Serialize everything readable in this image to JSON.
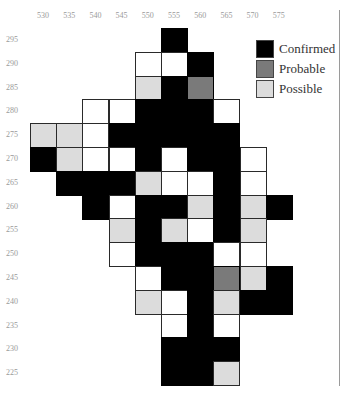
{
  "colors": {
    "confirmed": "#000000",
    "probable": "#7a7a7a",
    "possible": "#dcdcdc",
    "surveyed": "#ffffff"
  },
  "axes": {
    "x_labels": [
      "530",
      "535",
      "540",
      "545",
      "550",
      "555",
      "560",
      "565",
      "570",
      "575"
    ],
    "y_labels": [
      "295",
      "290",
      "285",
      "280",
      "275",
      "270",
      "265",
      "260",
      "255",
      "250",
      "245",
      "240",
      "235",
      "230",
      "225"
    ]
  },
  "legend": {
    "items": [
      {
        "key": "confirmed",
        "label": "Confirmed"
      },
      {
        "key": "probable",
        "label": "Probable"
      },
      {
        "key": "possible",
        "label": "Possible"
      }
    ]
  },
  "grid": {
    "origin_x": 30,
    "origin_y": 28,
    "cell_w": 26.2,
    "cell_h": 23.8,
    "cells": [
      {
        "x": 555,
        "y": 295,
        "s": "confirmed"
      },
      {
        "x": 550,
        "y": 290,
        "s": "surveyed"
      },
      {
        "x": 555,
        "y": 290,
        "s": "surveyed"
      },
      {
        "x": 560,
        "y": 290,
        "s": "confirmed"
      },
      {
        "x": 550,
        "y": 285,
        "s": "possible"
      },
      {
        "x": 555,
        "y": 285,
        "s": "confirmed"
      },
      {
        "x": 560,
        "y": 285,
        "s": "probable"
      },
      {
        "x": 540,
        "y": 280,
        "s": "surveyed"
      },
      {
        "x": 545,
        "y": 280,
        "s": "surveyed"
      },
      {
        "x": 550,
        "y": 280,
        "s": "confirmed"
      },
      {
        "x": 555,
        "y": 280,
        "s": "confirmed"
      },
      {
        "x": 560,
        "y": 280,
        "s": "confirmed"
      },
      {
        "x": 565,
        "y": 280,
        "s": "surveyed"
      },
      {
        "x": 530,
        "y": 275,
        "s": "possible"
      },
      {
        "x": 535,
        "y": 275,
        "s": "possible"
      },
      {
        "x": 540,
        "y": 275,
        "s": "surveyed"
      },
      {
        "x": 545,
        "y": 275,
        "s": "confirmed"
      },
      {
        "x": 550,
        "y": 275,
        "s": "confirmed"
      },
      {
        "x": 555,
        "y": 275,
        "s": "confirmed"
      },
      {
        "x": 560,
        "y": 275,
        "s": "confirmed"
      },
      {
        "x": 565,
        "y": 275,
        "s": "confirmed"
      },
      {
        "x": 530,
        "y": 270,
        "s": "confirmed"
      },
      {
        "x": 535,
        "y": 270,
        "s": "possible"
      },
      {
        "x": 540,
        "y": 270,
        "s": "surveyed"
      },
      {
        "x": 545,
        "y": 270,
        "s": "surveyed"
      },
      {
        "x": 550,
        "y": 270,
        "s": "confirmed"
      },
      {
        "x": 555,
        "y": 270,
        "s": "surveyed"
      },
      {
        "x": 560,
        "y": 270,
        "s": "confirmed"
      },
      {
        "x": 565,
        "y": 270,
        "s": "confirmed"
      },
      {
        "x": 570,
        "y": 270,
        "s": "surveyed"
      },
      {
        "x": 535,
        "y": 265,
        "s": "confirmed"
      },
      {
        "x": 540,
        "y": 265,
        "s": "confirmed"
      },
      {
        "x": 545,
        "y": 265,
        "s": "confirmed"
      },
      {
        "x": 550,
        "y": 265,
        "s": "possible"
      },
      {
        "x": 555,
        "y": 265,
        "s": "surveyed"
      },
      {
        "x": 560,
        "y": 265,
        "s": "surveyed"
      },
      {
        "x": 565,
        "y": 265,
        "s": "confirmed"
      },
      {
        "x": 570,
        "y": 265,
        "s": "surveyed"
      },
      {
        "x": 540,
        "y": 260,
        "s": "confirmed"
      },
      {
        "x": 545,
        "y": 260,
        "s": "surveyed"
      },
      {
        "x": 550,
        "y": 260,
        "s": "confirmed"
      },
      {
        "x": 555,
        "y": 260,
        "s": "confirmed"
      },
      {
        "x": 560,
        "y": 260,
        "s": "possible"
      },
      {
        "x": 565,
        "y": 260,
        "s": "confirmed"
      },
      {
        "x": 570,
        "y": 260,
        "s": "possible"
      },
      {
        "x": 575,
        "y": 260,
        "s": "confirmed"
      },
      {
        "x": 545,
        "y": 255,
        "s": "possible"
      },
      {
        "x": 550,
        "y": 255,
        "s": "confirmed"
      },
      {
        "x": 555,
        "y": 255,
        "s": "possible"
      },
      {
        "x": 560,
        "y": 255,
        "s": "surveyed"
      },
      {
        "x": 565,
        "y": 255,
        "s": "confirmed"
      },
      {
        "x": 570,
        "y": 255,
        "s": "possible"
      },
      {
        "x": 545,
        "y": 250,
        "s": "surveyed"
      },
      {
        "x": 550,
        "y": 250,
        "s": "confirmed"
      },
      {
        "x": 555,
        "y": 250,
        "s": "confirmed"
      },
      {
        "x": 560,
        "y": 250,
        "s": "confirmed"
      },
      {
        "x": 565,
        "y": 250,
        "s": "surveyed"
      },
      {
        "x": 570,
        "y": 250,
        "s": "surveyed"
      },
      {
        "x": 550,
        "y": 245,
        "s": "surveyed"
      },
      {
        "x": 555,
        "y": 245,
        "s": "confirmed"
      },
      {
        "x": 560,
        "y": 245,
        "s": "confirmed"
      },
      {
        "x": 565,
        "y": 245,
        "s": "probable"
      },
      {
        "x": 570,
        "y": 245,
        "s": "possible"
      },
      {
        "x": 575,
        "y": 245,
        "s": "confirmed"
      },
      {
        "x": 550,
        "y": 240,
        "s": "possible"
      },
      {
        "x": 555,
        "y": 240,
        "s": "surveyed"
      },
      {
        "x": 560,
        "y": 240,
        "s": "confirmed"
      },
      {
        "x": 565,
        "y": 240,
        "s": "possible"
      },
      {
        "x": 570,
        "y": 240,
        "s": "confirmed"
      },
      {
        "x": 575,
        "y": 240,
        "s": "confirmed"
      },
      {
        "x": 555,
        "y": 235,
        "s": "surveyed"
      },
      {
        "x": 560,
        "y": 235,
        "s": "confirmed"
      },
      {
        "x": 565,
        "y": 235,
        "s": "surveyed"
      },
      {
        "x": 555,
        "y": 230,
        "s": "confirmed"
      },
      {
        "x": 560,
        "y": 230,
        "s": "confirmed"
      },
      {
        "x": 565,
        "y": 230,
        "s": "confirmed"
      },
      {
        "x": 555,
        "y": 225,
        "s": "confirmed"
      },
      {
        "x": 560,
        "y": 225,
        "s": "confirmed"
      },
      {
        "x": 565,
        "y": 225,
        "s": "possible"
      }
    ]
  }
}
